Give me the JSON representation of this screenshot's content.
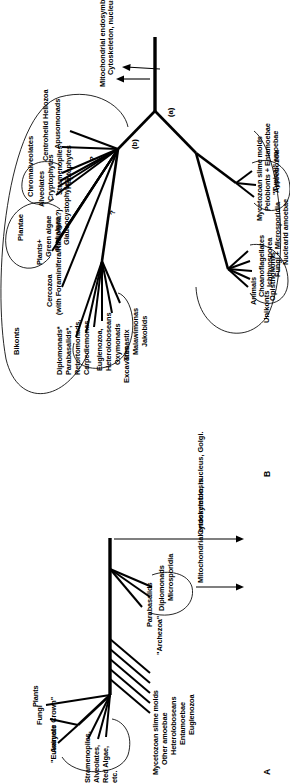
{
  "figure": {
    "panel_a_label": "A",
    "panel_b_label": "B"
  },
  "panel_a": {
    "crown_bracket": "\"Eukaryote Crown\"",
    "crown_taxa": [
      "Animals",
      "Fungi",
      "Plants",
      "Stramenopiles,",
      "Alveolates,",
      "Red Algae,",
      "etc."
    ],
    "basal_taxa": [
      "Mycetozoan slime molds",
      "Other amoebae",
      "Heteroloboseans",
      "Entamoebae",
      "Euglenozoa"
    ],
    "archezoa_bracket": "\"Archezoa\"",
    "archezoa_taxa": [
      "Parabasalids",
      "Diplomonads",
      "Microsporidia"
    ],
    "events": [
      "Mitochondrial endosymbiosis",
      "Cytoskeleton, nucleus, Golgi."
    ]
  },
  "panel_b": {
    "supergroups": {
      "unikonts": "Unikonts",
      "bikonts": "Bikonts",
      "opisthokonts": "Opisthokonts",
      "amoebozoa": "Amoebozoa",
      "excavates": "Excavates",
      "plantae": "Plantae",
      "chromalveolates": "Chromalveolates"
    },
    "opisthokont_taxa": [
      "Animals",
      "Choanoflagellates",
      "Ichthyosporea",
      "Fungi + Microsporidia",
      "Nuclearid amoebae"
    ],
    "amoebozoa_taxa": [
      "Mycetozoan slime molds",
      "Pelobionts + Entamoebae",
      "\"Typical\" amoebae"
    ],
    "excavate_taxa": [
      "Diplomonads*",
      "Parabasalids*,",
      "Retortomonads,",
      "Carpediemonas",
      "Euglenozoa,",
      "Heteroloboseans",
      "Oxymonads",
      "Trimastix",
      "Malawimonas",
      "Jakobids"
    ],
    "cercozoa": [
      "Cercozoa",
      "(with Foraminifera/Radiolaria?)"
    ],
    "plantae_taxa": [
      "Plants+",
      "Green algae",
      "Red algae",
      "Glaucocystophytes"
    ],
    "chromalveolate_taxa": [
      "Alveolates",
      "Cryptophytes",
      "Stramenopiles",
      "Haptophytes"
    ],
    "other_taxa": [
      "Centrohelid Heliozoa",
      "Apusomonads"
    ],
    "nodes": {
      "a": "(a)",
      "b": "(b)"
    },
    "uncertainty_marks": [
      "?",
      "?"
    ],
    "events": [
      "Mitochondrial endosymbiosis?",
      "Cytoskeleton, nucleus, Golgi."
    ]
  }
}
